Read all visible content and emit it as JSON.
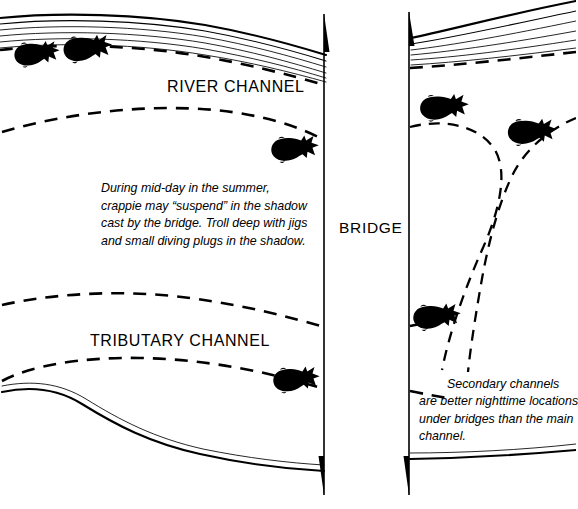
{
  "diagram": {
    "background_color": "#ffffff",
    "ink_color": "#000000",
    "labels": {
      "river_channel": "RIVER CHANNEL",
      "tributary_channel": "TRIBUTARY CHANNEL",
      "bridge": "BRIDGE"
    },
    "notes": {
      "midday": {
        "lines": [
          "During mid-day in the summer,",
          "crappie may “suspend” in the shadow",
          "cast by the bridge.  Troll deep with jigs",
          "and small diving plugs in the shadow."
        ]
      },
      "secondary": {
        "lines": [
          "Secondary  channels",
          "are better nighttime locations",
          "under bridges than the main",
          "channel."
        ]
      }
    },
    "features": {
      "bridge_deck": {
        "name": "bridge",
        "left_edge_x": 324,
        "right_edge_x": 409,
        "orientation": "vertical"
      },
      "shorelines": [
        {
          "name": "upper-left-bank",
          "contour_count": 6
        },
        {
          "name": "upper-right-bank",
          "contour_count": 6
        },
        {
          "name": "lower-left-bank",
          "contour_count": 2
        },
        {
          "name": "lower-right-bank",
          "contour_count": 2
        }
      ],
      "channel_edges": [
        {
          "name": "river-channel-north-edge",
          "style": "dashed"
        },
        {
          "name": "river-channel-south-edge",
          "style": "dashed"
        },
        {
          "name": "tributary-channel-north-edge",
          "style": "dashed"
        },
        {
          "name": "tributary-channel-south-edge",
          "style": "dashed"
        },
        {
          "name": "secondary-channel-east-edge",
          "style": "dashed"
        },
        {
          "name": "secondary-channel-west-edge",
          "style": "dashed"
        }
      ],
      "fish": [
        {
          "name": "fish-upper-left-1",
          "x": 34,
          "y": 60,
          "facing": "left"
        },
        {
          "name": "fish-upper-left-2",
          "x": 84,
          "y": 55,
          "facing": "left"
        },
        {
          "name": "fish-river-channel",
          "x": 294,
          "y": 152,
          "facing": "left"
        },
        {
          "name": "fish-bridge-east-1",
          "x": 443,
          "y": 111,
          "facing": "left"
        },
        {
          "name": "fish-bridge-east-2",
          "x": 531,
          "y": 134,
          "facing": "left"
        },
        {
          "name": "fish-secondary-channel",
          "x": 436,
          "y": 320,
          "facing": "left"
        },
        {
          "name": "fish-tributary-channel",
          "x": 296,
          "y": 383,
          "facing": "left"
        }
      ],
      "fish_species": "crappie",
      "fish_count": 7
    }
  }
}
